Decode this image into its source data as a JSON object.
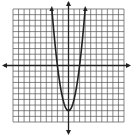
{
  "chart_data": {
    "type": "line",
    "title": "",
    "xlabel": "",
    "ylabel": "",
    "equation": "y = 2x^2 - 8",
    "xlim": [
      -10,
      10
    ],
    "ylim": [
      -10,
      10
    ],
    "grid": true,
    "legend": null,
    "series": [
      {
        "name": "parabola",
        "x": [
          -3,
          -2.5,
          -2,
          -1.5,
          -1,
          -0.5,
          0,
          0.5,
          1,
          1.5,
          2,
          2.5,
          3
        ],
        "y": [
          10,
          4.5,
          0,
          -3.5,
          -6,
          -7.5,
          -8,
          -7.5,
          -6,
          -3.5,
          0,
          4.5,
          10
        ]
      }
    ],
    "vertex": [
      0,
      -8
    ],
    "x_intercepts": [
      -2,
      2
    ],
    "colors": {
      "grid": "#555555",
      "axis": "#222222",
      "curve": "#222222",
      "background": "#ffffff"
    }
  }
}
